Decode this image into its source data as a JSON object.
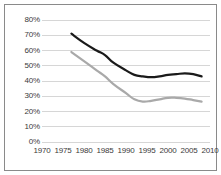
{
  "chart_data": {
    "type": "line",
    "title": "",
    "subtitle": "",
    "xlabel": "",
    "ylabel": "",
    "xlim": [
      1970,
      2010
    ],
    "ylim": [
      0,
      0.8
    ],
    "grid": true,
    "grid_axis": "y",
    "legend": "none",
    "y_tick_labels": [
      "0%",
      "10%",
      "20%",
      "30%",
      "40%",
      "50%",
      "60%",
      "70%",
      "80%"
    ],
    "y_tick_values": [
      0,
      10,
      20,
      30,
      40,
      50,
      60,
      70,
      80
    ],
    "x_tick_labels": [
      "1970",
      "1975",
      "1980",
      "1985",
      "1990",
      "1995",
      "2000",
      "2005",
      "2010"
    ],
    "x_tick_values": [
      1970,
      1975,
      1980,
      1985,
      1990,
      1995,
      2000,
      2005,
      2010
    ],
    "series": [
      {
        "name": "series-dark",
        "color": "#1a1a1a",
        "x": [
          1977,
          1980,
          1983,
          1985,
          1987,
          1990,
          1992,
          1994,
          1996,
          1998,
          2000,
          2002,
          2004,
          2006,
          2008
        ],
        "values": [
          71,
          65,
          60,
          57,
          52,
          47,
          44,
          43,
          42.5,
          43,
          44,
          44.5,
          45,
          44.5,
          43
        ]
      },
      {
        "name": "series-gray",
        "color": "#a9a9a9",
        "x": [
          1977,
          1980,
          1983,
          1985,
          1987,
          1990,
          1992,
          1994,
          1996,
          1998,
          2000,
          2002,
          2004,
          2006,
          2008
        ],
        "values": [
          59,
          53,
          47,
          43,
          38,
          32,
          28,
          26.5,
          27,
          28,
          29,
          29,
          28.5,
          27.5,
          26.5
        ]
      }
    ]
  },
  "colors": {
    "border": "#8a8a8a",
    "gridline": "#d6d6d6",
    "axis_text": "#3b3b3b",
    "series_dark": "#1a1a1a",
    "series_gray": "#a9a9a9",
    "background": "#ffffff"
  }
}
